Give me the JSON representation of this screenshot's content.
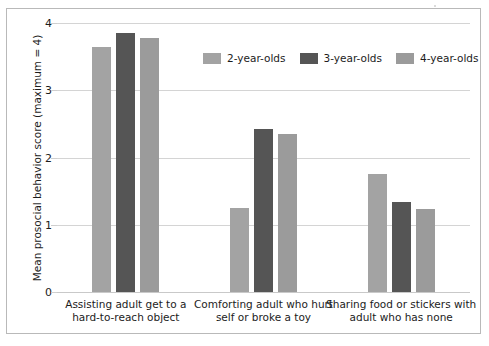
{
  "chart_data": {
    "type": "bar",
    "title": "",
    "xlabel": "",
    "ylabel": "Mean prosocial behavior score (maximum = 4)",
    "ylim": [
      0,
      4
    ],
    "yticks": [
      "0",
      "1",
      "2",
      "3",
      "4"
    ],
    "grid": true,
    "legend_position": "top-center",
    "categories": [
      "Assisting adult get to a\nhard-to-reach object",
      "Comforting adult who hurt\nself or broke a toy",
      "Sharing food or stickers with\nadult who has none"
    ],
    "category_lines": [
      [
        "Assisting adult get to a",
        "hard-to-reach object"
      ],
      [
        "Comforting adult who hurt",
        "self or broke a toy"
      ],
      [
        "Sharing food or stickers with",
        "adult who has none"
      ]
    ],
    "series": [
      {
        "name": "2-year-olds",
        "color": "#a3a3a3",
        "values": [
          3.65,
          1.25,
          1.75
        ]
      },
      {
        "name": "3-year-olds",
        "color": "#555555",
        "values": [
          3.85,
          2.42,
          1.34
        ]
      },
      {
        "name": "4-year-olds",
        "color": "#9b9b9b",
        "values": [
          3.77,
          2.35,
          1.23
        ]
      }
    ]
  },
  "legend": {
    "items": [
      {
        "label": "2-year-olds"
      },
      {
        "label": "3-year-olds"
      },
      {
        "label": "4-year-olds"
      }
    ]
  },
  "axes": {
    "y_title": "Mean prosocial behavior score (maximum = 4)",
    "y_tick_labels": [
      "0",
      "1",
      "2",
      "3",
      "4"
    ]
  }
}
